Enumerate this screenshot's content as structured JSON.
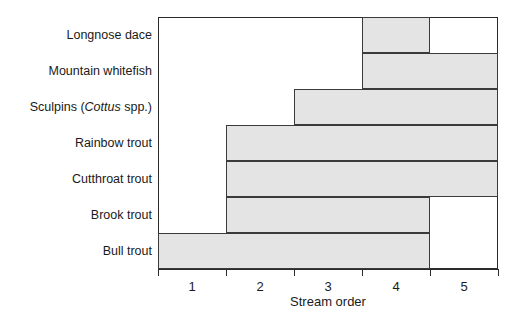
{
  "chart_data": {
    "type": "bar",
    "orientation": "horizontal",
    "title": "",
    "xlabel": "Stream order",
    "ylabel": "",
    "xlim": [
      0.5,
      5.5
    ],
    "grid": false,
    "legend": null,
    "xticks": [
      {
        "value": 0.5,
        "label": ""
      },
      {
        "value": 1.5,
        "label": ""
      },
      {
        "value": 2.5,
        "label": ""
      },
      {
        "value": 3.5,
        "label": ""
      },
      {
        "value": 4.5,
        "label": ""
      },
      {
        "value": 5.5,
        "label": ""
      }
    ],
    "xtick_labels": [
      "1",
      "2",
      "3",
      "4",
      "5"
    ],
    "xtick_label_values": [
      1,
      2,
      3,
      4,
      5
    ],
    "categories": [
      "Longnose dace",
      "Mountain whitefish",
      "Sculpins (Cottus spp.)",
      "Rainbow trout",
      "Cutthroat trout",
      "Brook trout",
      "Bull trout"
    ],
    "bars": [
      {
        "category": "Longnose dace",
        "start": 3.5,
        "end": 4.5,
        "label_html": "Longnose dace"
      },
      {
        "category": "Mountain whitefish",
        "start": 3.5,
        "end": 5.5,
        "label_html": "Mountain whitefish"
      },
      {
        "category": "Sculpins (Cottus spp.)",
        "start": 2.5,
        "end": 5.5,
        "label_html": "Sculpins (<i>Cottus</i> spp.)"
      },
      {
        "category": "Rainbow trout",
        "start": 1.5,
        "end": 5.5,
        "label_html": "Rainbow trout"
      },
      {
        "category": "Cutthroat trout",
        "start": 1.5,
        "end": 5.5,
        "label_html": "Cutthroat trout"
      },
      {
        "category": "Brook trout",
        "start": 1.5,
        "end": 4.5,
        "label_html": "Brook trout"
      },
      {
        "category": "Bull trout",
        "start": 0.5,
        "end": 4.5,
        "label_html": "Bull trout"
      }
    ],
    "colors": {
      "bar_fill": "#e4e4e4",
      "bar_stroke": "#3a3a3a",
      "axis": "#2b2b2b",
      "text": "#1a1a1a",
      "background": "#ffffff"
    }
  }
}
